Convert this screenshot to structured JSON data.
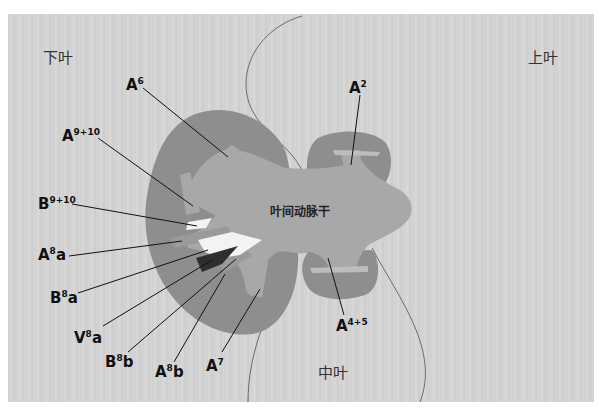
{
  "lobes": {
    "lower": "下叶",
    "upper": "上叶",
    "middle": "中叶"
  },
  "trunk_label": "叶间动脉干",
  "labels": [
    {
      "id": "a6",
      "base": "A",
      "sup": "6",
      "suffix": ""
    },
    {
      "id": "a2",
      "base": "A",
      "sup": "2",
      "suffix": ""
    },
    {
      "id": "a9_10",
      "base": "A",
      "sup": "9+10",
      "suffix": ""
    },
    {
      "id": "b9_10",
      "base": "B",
      "sup": "9+10",
      "suffix": ""
    },
    {
      "id": "a8a",
      "base": "A",
      "sup": "8",
      "suffix": "a"
    },
    {
      "id": "b8a",
      "base": "B",
      "sup": "8",
      "suffix": "a"
    },
    {
      "id": "v8a",
      "base": "V",
      "sup": "8",
      "suffix": "a"
    },
    {
      "id": "b8b",
      "base": "B",
      "sup": "8",
      "suffix": "b"
    },
    {
      "id": "a8b",
      "base": "A",
      "sup": "8",
      "suffix": "b"
    },
    {
      "id": "a7",
      "base": "A",
      "sup": "7",
      "suffix": ""
    },
    {
      "id": "a4_5",
      "base": "A",
      "sup": "4+5",
      "suffix": ""
    }
  ],
  "colors": {
    "background": "#d3d3d3",
    "lobe_tissue": "#8c8c8c",
    "artery": "#a6a6a6",
    "bronchus": "#f2f2f2",
    "vein": "#333333",
    "boundary_line": "#666666"
  }
}
